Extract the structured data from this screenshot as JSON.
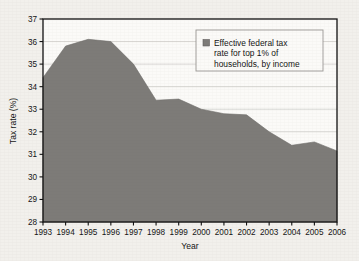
{
  "chart_data": {
    "type": "area",
    "title": "",
    "xlabel": "Year",
    "ylabel": "Tax rate (%)",
    "categories": [
      1993,
      1994,
      1995,
      1996,
      1997,
      1998,
      1999,
      2000,
      2001,
      2002,
      2003,
      2004,
      2005,
      2006
    ],
    "x_tick_labels": [
      "1993",
      "1994",
      "1995",
      "1996",
      "1997",
      "1998",
      "1999",
      "2000",
      "2001",
      "2002",
      "2003",
      "2004",
      "2005",
      "2006"
    ],
    "y_tick_labels": [
      "28",
      "29",
      "30",
      "31",
      "32",
      "33",
      "34",
      "35",
      "36",
      "37"
    ],
    "y_ticks": [
      28,
      29,
      30,
      31,
      32,
      33,
      34,
      35,
      36,
      37
    ],
    "ylim": [
      28,
      37
    ],
    "xlim": [
      1993,
      2006
    ],
    "grid": "horizontal",
    "legend_position": "top-right",
    "series": [
      {
        "name": "Effective federal tax rate for top 1% of households, by income",
        "values": [
          34.4,
          35.8,
          36.1,
          36.0,
          35.0,
          33.4,
          33.45,
          33.0,
          32.8,
          32.75,
          32.0,
          31.4,
          31.55,
          31.15
        ],
        "color": "#7d7b78",
        "fill": true
      }
    ],
    "legend": [
      {
        "swatch_color": "#7d7b78",
        "lines": [
          "Effective federal tax",
          "rate for top 1% of",
          "households, by income"
        ],
        "label": "Effective federal tax rate for top 1% of households, by income"
      }
    ],
    "colors": {
      "area_fill": "#7d7b78",
      "plot_background": "#fbfaf8",
      "page_background": "#f2f0ec",
      "axis": "#101010",
      "gridline": "#c9c7c3",
      "legend_border": "#9a9894",
      "text": "#141414"
    }
  }
}
